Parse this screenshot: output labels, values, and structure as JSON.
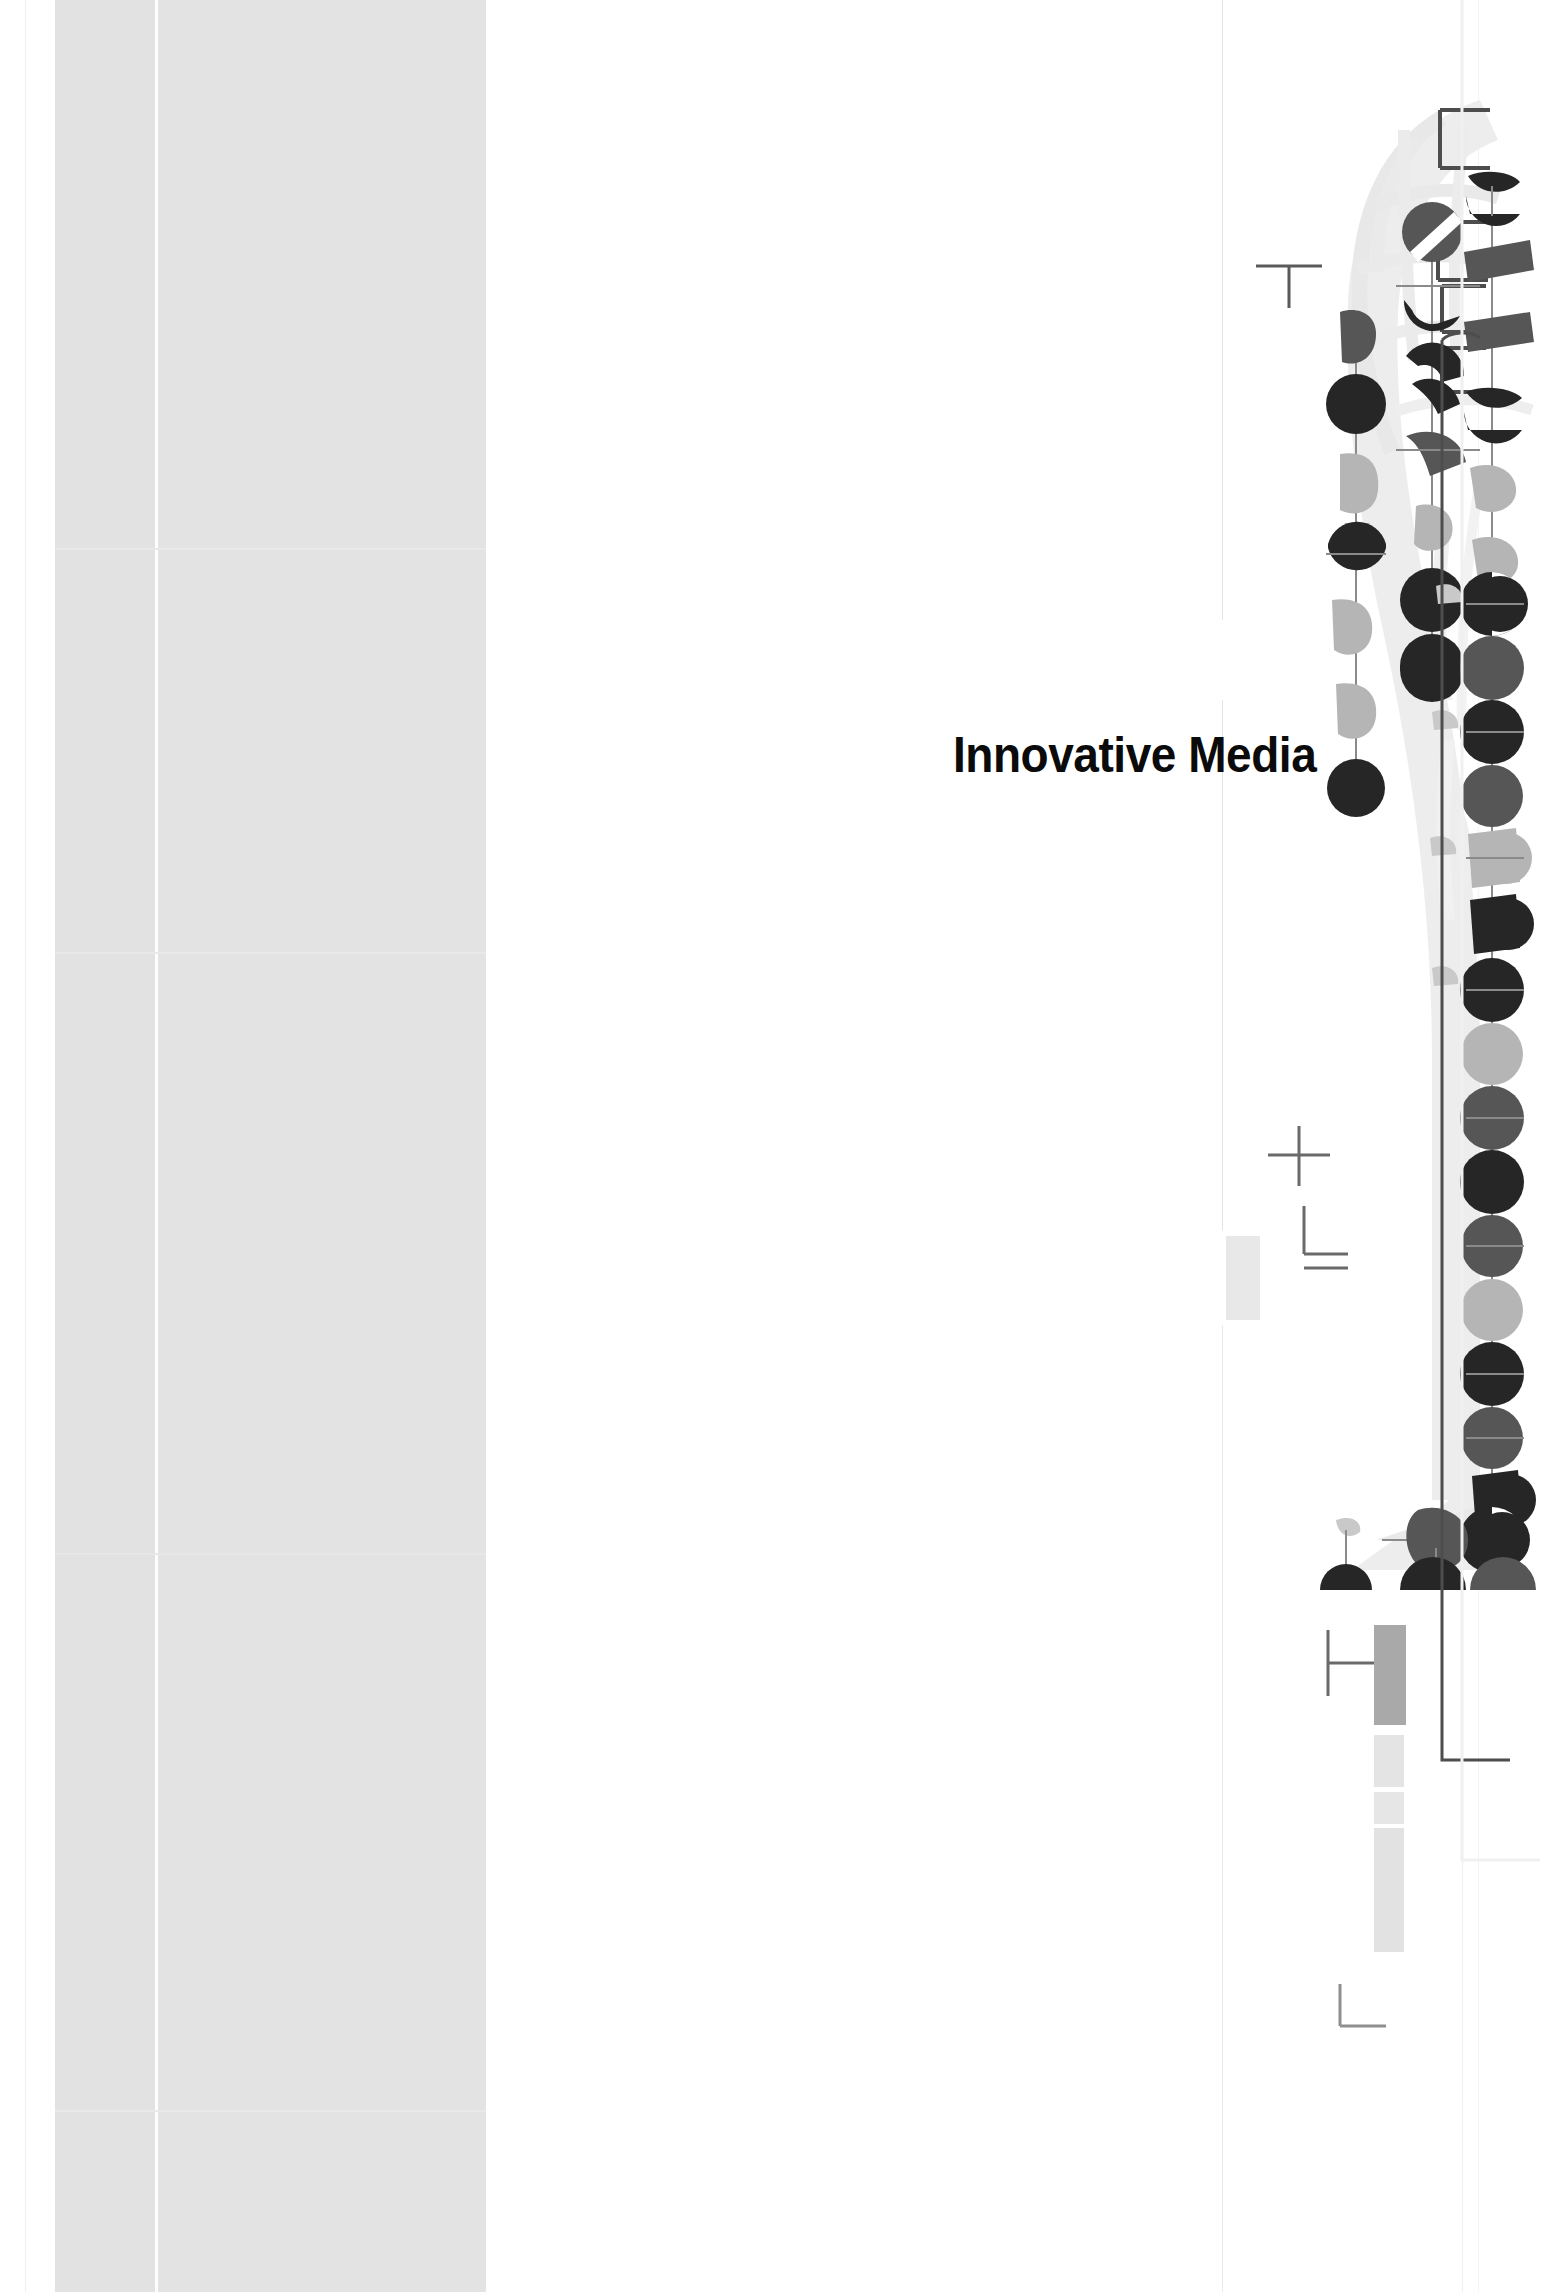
{
  "page": {
    "width": 1549,
    "height": 2292,
    "background": "#ffffff",
    "kind": "print-proof-cover-scan"
  },
  "title": {
    "text": "Innovative Media",
    "color": "#0b0b0b",
    "weight": "bold-condensed"
  },
  "palette": {
    "paper": "#ffffff",
    "panel_grey": "#e3e3e3",
    "panel_grey_light": "#e2e2e2",
    "node_dark": "#262626",
    "node_mid": "#565656",
    "node_light": "#b5b5b5",
    "swoosh_grey": "#ebebeb",
    "rule_grey": "#ececec",
    "frame_dark": "#4d4d4d",
    "tone_bar_mid": "#a9a9a9",
    "tone_bar_light": "#e4e4e4"
  },
  "left_panel": {
    "label": "flat grey tint block",
    "bands": [
      {
        "name": "narrow-band",
        "x": 55,
        "width": 100,
        "tone": "#e2e2e2"
      },
      {
        "name": "wide-band",
        "x": 158,
        "width": 328,
        "tone": "#e3e3e3"
      }
    ],
    "seam_rows": [
      548,
      952,
      1553,
      2110
    ]
  },
  "artwork": {
    "name": "abstract-node-chain-graphic",
    "description": "Light grey arc swoosh overlaid with chains of circles, half-circles and wedge shapes linked by thin stems",
    "swoosh_tone": "#ebebeb",
    "node_chains": [
      {
        "name": "outer-left-chain",
        "nodes": [
          {
            "y": 330,
            "tone": "#565656",
            "shape": "wedge"
          },
          {
            "y": 404,
            "tone": "#262626",
            "shape": "circle"
          },
          {
            "y": 478,
            "tone": "#b5b5b5",
            "shape": "wedge"
          },
          {
            "y": 552,
            "tone": "#262626",
            "shape": "half-circle"
          },
          {
            "y": 626,
            "tone": "#b5b5b5",
            "shape": "wedge"
          },
          {
            "y": 700,
            "tone": "#b5b5b5",
            "shape": "wedge"
          },
          {
            "y": 774,
            "tone": "#262626",
            "shape": "circle"
          }
        ]
      },
      {
        "name": "inner-chain",
        "nodes": [
          {
            "y": 228,
            "tone": "#565656",
            "shape": "circle-split"
          },
          {
            "y": 302,
            "tone": "#262626",
            "shape": "c-shape"
          },
          {
            "y": 376,
            "tone": "#262626",
            "shape": "c-shape"
          },
          {
            "y": 450,
            "tone": "#565656",
            "shape": "wedge"
          },
          {
            "y": 524,
            "tone": "#b5b5b5",
            "shape": "wedge"
          },
          {
            "y": 598,
            "tone": "#262626",
            "shape": "circle"
          },
          {
            "y": 672,
            "tone": "#262626",
            "shape": "half-circle"
          }
        ]
      },
      {
        "name": "spine-chain",
        "nodes": [
          {
            "y": 188,
            "tone": "#262626",
            "shape": "cap"
          },
          {
            "y": 262,
            "tone": "#565656",
            "shape": "bar"
          },
          {
            "y": 336,
            "tone": "#565656",
            "shape": "bar"
          },
          {
            "y": 410,
            "tone": "#262626",
            "shape": "cap"
          },
          {
            "y": 484,
            "tone": "#b5b5b5",
            "shape": "wedge"
          },
          {
            "y": 558,
            "tone": "#b5b5b5",
            "shape": "wedge"
          },
          {
            "y": 598,
            "tone": "#262626",
            "shape": "circle"
          },
          {
            "y": 660,
            "tone": "#565656",
            "shape": "circle"
          },
          {
            "y": 724,
            "tone": "#262626",
            "shape": "circle"
          },
          {
            "y": 788,
            "tone": "#565656",
            "shape": "circle"
          },
          {
            "y": 852,
            "tone": "#b5b5b5",
            "shape": "cylinder"
          },
          {
            "y": 916,
            "tone": "#262626",
            "shape": "cylinder"
          },
          {
            "y": 980,
            "tone": "#262626",
            "shape": "circle"
          },
          {
            "y": 1044,
            "tone": "#b5b5b5",
            "shape": "circle"
          },
          {
            "y": 1108,
            "tone": "#565656",
            "shape": "circle"
          },
          {
            "y": 1172,
            "tone": "#262626",
            "shape": "circle"
          },
          {
            "y": 1236,
            "tone": "#565656",
            "shape": "circle"
          },
          {
            "y": 1300,
            "tone": "#b5b5b5",
            "shape": "circle"
          },
          {
            "y": 1364,
            "tone": "#262626",
            "shape": "circle"
          },
          {
            "y": 1428,
            "tone": "#565656",
            "shape": "circle"
          },
          {
            "y": 1492,
            "tone": "#262626",
            "shape": "cylinder"
          }
        ]
      },
      {
        "name": "base-cluster",
        "nodes": [
          {
            "y": 1538,
            "tone": "#262626",
            "shape": "circle"
          },
          {
            "y": 1538,
            "tone": "#565656",
            "shape": "pentagon"
          },
          {
            "y": 1582,
            "tone": "#262626",
            "shape": "dome"
          },
          {
            "y": 1582,
            "tone": "#262626",
            "shape": "dome"
          },
          {
            "y": 1582,
            "tone": "#565656",
            "shape": "dome"
          }
        ]
      }
    ]
  },
  "registration_marks": [
    {
      "name": "t-mark-upper",
      "glyph": "T",
      "x": 1255,
      "y": 262
    },
    {
      "name": "plus-mark",
      "glyph": "+",
      "x": 1298,
      "y": 1148
    },
    {
      "name": "corner-mark-upper",
      "glyph": "⌐",
      "x": 1330,
      "y": 1200
    },
    {
      "name": "t-mark-lower",
      "glyph": "⊢",
      "x": 1325,
      "y": 1658
    },
    {
      "name": "corner-mark-lower",
      "glyph": "L",
      "x": 1343,
      "y": 1985
    },
    {
      "name": "bracket-mark-left",
      "glyph": "├",
      "x": 1329,
      "y": 1660
    }
  ],
  "bracket_marks": [
    {
      "name": "bracket-top-right-1",
      "x": 1427,
      "y": 128
    },
    {
      "name": "bracket-top-right-2",
      "x": 1440,
      "y": 232
    },
    {
      "name": "bracket-top-right-3",
      "x": 1444,
      "y": 258
    },
    {
      "name": "bracket-top-right-4",
      "x": 1444,
      "y": 376
    }
  ],
  "tone_bars": {
    "name": "density-control-strip",
    "bars": [
      {
        "tone": "#a9a9a9",
        "height": 100
      },
      {
        "tone": "#e4e4e4",
        "height": 52
      },
      {
        "tone": "#e6e6e6",
        "height": 32
      },
      {
        "tone": "#e2e2e2",
        "height": 124
      }
    ]
  },
  "frame_rules": {
    "name": "trim-frame",
    "dark_rule_x": 1441,
    "light_rule_x": 1462,
    "light_rule_x2": 1478
  }
}
